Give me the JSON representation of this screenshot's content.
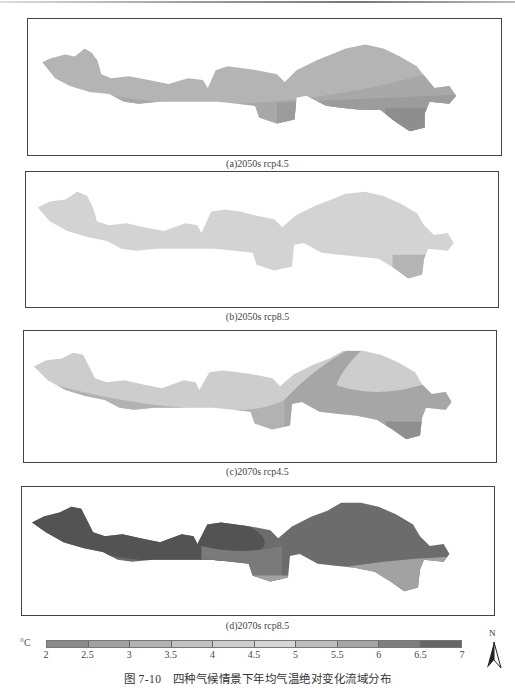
{
  "figure": {
    "title": "图 7-10　四种气候情景下年均气温绝对变化流域分布",
    "unit": "°C"
  },
  "panels": [
    {
      "id": "a",
      "caption": "(a)2050s rcp4.5",
      "zones": [
        "#b4b4b4",
        "#a8a8a8",
        "#9c9c9c",
        "#8e8e8e"
      ]
    },
    {
      "id": "b",
      "caption": "(b)2050s rcp8.5",
      "zones": [
        "#d4d4d4",
        "#d2d2d2",
        "#d0d0d0",
        "#b2b2b2"
      ]
    },
    {
      "id": "c",
      "caption": "(c)2070s rcp4.5",
      "zones": [
        "#cdcdcd",
        "#b2b2b2",
        "#a6a6a6",
        "#8f8f8f"
      ]
    },
    {
      "id": "d",
      "caption": "(d)2070s rcp8.5",
      "zones": [
        "#535353",
        "#6c6c6c",
        "#7a7a7a",
        "#a2a2a2"
      ]
    }
  ],
  "legend": {
    "ticks": [
      "2",
      "2.5",
      "3",
      "3.5",
      "4",
      "4.5",
      "5",
      "5.5",
      "6",
      "6.5",
      "7"
    ],
    "colors": [
      "#8a8a8a",
      "#a0a0a0",
      "#b2b2b2",
      "#c2c2c2",
      "#cecece",
      "#d6d6d6",
      "#bdbdbd",
      "#a5a5a5",
      "#7e7e7e",
      "#666666"
    ]
  },
  "north_arrow": {
    "label": "N"
  }
}
